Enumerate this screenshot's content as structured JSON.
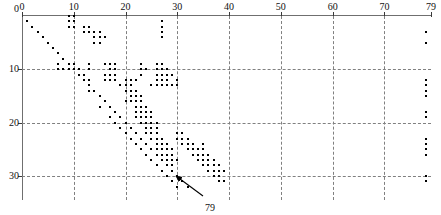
{
  "figure": {
    "title": "",
    "kind": "sparse-matrix-spy-plot"
  },
  "annotation": {
    "label": "79",
    "x": 205,
    "y": 203,
    "arrow_from_x": 203,
    "arrow_from_y": 196,
    "arrow_to_x": 176,
    "arrow_to_y": 176
  },
  "chart_data": {
    "type": "scatter",
    "title": "",
    "xlabel": "",
    "ylabel": "",
    "xlim": [
      0,
      79
    ],
    "ylim": [
      0,
      33
    ],
    "grid": true,
    "legend": null,
    "x_axis_position": "top",
    "y_axis_direction": "down",
    "xticks": [
      0,
      10,
      20,
      30,
      40,
      50,
      60,
      70,
      79
    ],
    "xticklabels": [
      "0",
      "10",
      "20",
      "30",
      "40",
      "50",
      "60",
      "70",
      "79"
    ],
    "yticks": [
      0,
      10,
      20,
      30
    ],
    "yticklabels": [
      "0",
      "10",
      "20",
      "30"
    ],
    "gridlines_x": [
      10,
      20,
      30,
      40,
      50,
      60,
      70
    ],
    "gridlines_y": [
      10,
      20,
      30
    ],
    "marker": "square",
    "marker_color": "#000000",
    "marker_size_px": 2,
    "points": [
      [
        1,
        1
      ],
      [
        2,
        2
      ],
      [
        3,
        3
      ],
      [
        4,
        4
      ],
      [
        5,
        5
      ],
      [
        6,
        6
      ],
      [
        7,
        7
      ],
      [
        8,
        8
      ],
      [
        9,
        9
      ],
      [
        10,
        10
      ],
      [
        11,
        11
      ],
      [
        12,
        12
      ],
      [
        13,
        13
      ],
      [
        14,
        14
      ],
      [
        15,
        15
      ],
      [
        16,
        16
      ],
      [
        17,
        17
      ],
      [
        18,
        18
      ],
      [
        19,
        19
      ],
      [
        20,
        20
      ],
      [
        21,
        21
      ],
      [
        22,
        22
      ],
      [
        23,
        23
      ],
      [
        24,
        24
      ],
      [
        25,
        25
      ],
      [
        26,
        26
      ],
      [
        27,
        27
      ],
      [
        28,
        28
      ],
      [
        29,
        29
      ],
      [
        30,
        30
      ],
      [
        31,
        31
      ],
      [
        32,
        32
      ],
      [
        9,
        0
      ],
      [
        10,
        0
      ],
      [
        9,
        1
      ],
      [
        10,
        1
      ],
      [
        9,
        2
      ],
      [
        10,
        2
      ],
      [
        12,
        2
      ],
      [
        13,
        2
      ],
      [
        12,
        3
      ],
      [
        13,
        3
      ],
      [
        14,
        3
      ],
      [
        15,
        3
      ],
      [
        14,
        4
      ],
      [
        15,
        4
      ],
      [
        16,
        4
      ],
      [
        14,
        5
      ],
      [
        15,
        5
      ],
      [
        27,
        1
      ],
      [
        27,
        2
      ],
      [
        27,
        3
      ],
      [
        27,
        4
      ],
      [
        7,
        9
      ],
      [
        9,
        9
      ],
      [
        10,
        9
      ],
      [
        13,
        9
      ],
      [
        16,
        9
      ],
      [
        17,
        9
      ],
      [
        18,
        9
      ],
      [
        7,
        10
      ],
      [
        8,
        10
      ],
      [
        9,
        10
      ],
      [
        11,
        10
      ],
      [
        13,
        10
      ],
      [
        17,
        10
      ],
      [
        18,
        10
      ],
      [
        23,
        9
      ],
      [
        26,
        9
      ],
      [
        27,
        9
      ],
      [
        11,
        11
      ],
      [
        12,
        11
      ],
      [
        16,
        11
      ],
      [
        17,
        11
      ],
      [
        18,
        11
      ],
      [
        23,
        10
      ],
      [
        24,
        10
      ],
      [
        26,
        10
      ],
      [
        27,
        10
      ],
      [
        28,
        10
      ],
      [
        12,
        12
      ],
      [
        13,
        12
      ],
      [
        16,
        12
      ],
      [
        17,
        12
      ],
      [
        18,
        12
      ],
      [
        23,
        11
      ],
      [
        26,
        11
      ],
      [
        27,
        11
      ],
      [
        28,
        11
      ],
      [
        29,
        11
      ],
      [
        20,
        12
      ],
      [
        21,
        12
      ],
      [
        22,
        12
      ],
      [
        26,
        12
      ],
      [
        27,
        12
      ],
      [
        28,
        12
      ],
      [
        30,
        12
      ],
      [
        19,
        13
      ],
      [
        20,
        13
      ],
      [
        21,
        13
      ],
      [
        25,
        13
      ],
      [
        26,
        13
      ],
      [
        27,
        13
      ],
      [
        28,
        13
      ],
      [
        29,
        13
      ],
      [
        30,
        13
      ],
      [
        13,
        14
      ],
      [
        20,
        14
      ],
      [
        21,
        14
      ],
      [
        22,
        14
      ],
      [
        21,
        15
      ],
      [
        22,
        15
      ],
      [
        23,
        15
      ],
      [
        20,
        16
      ],
      [
        21,
        16
      ],
      [
        22,
        16
      ],
      [
        23,
        16
      ],
      [
        15,
        17
      ],
      [
        22,
        17
      ],
      [
        23,
        17
      ],
      [
        24,
        17
      ],
      [
        22,
        18
      ],
      [
        23,
        18
      ],
      [
        24,
        18
      ],
      [
        25,
        18
      ],
      [
        17,
        19
      ],
      [
        22,
        19
      ],
      [
        23,
        19
      ],
      [
        24,
        19
      ],
      [
        25,
        19
      ],
      [
        18,
        20
      ],
      [
        23,
        20
      ],
      [
        24,
        20
      ],
      [
        25,
        20
      ],
      [
        26,
        20
      ],
      [
        19,
        21
      ],
      [
        24,
        21
      ],
      [
        25,
        21
      ],
      [
        26,
        21
      ],
      [
        20,
        22
      ],
      [
        24,
        22
      ],
      [
        25,
        22
      ],
      [
        26,
        22
      ],
      [
        30,
        22
      ],
      [
        31,
        22
      ],
      [
        21,
        23
      ],
      [
        25,
        23
      ],
      [
        26,
        23
      ],
      [
        27,
        23
      ],
      [
        30,
        23
      ],
      [
        31,
        23
      ],
      [
        32,
        23
      ],
      [
        22,
        24
      ],
      [
        26,
        24
      ],
      [
        27,
        24
      ],
      [
        28,
        24
      ],
      [
        31,
        24
      ],
      [
        32,
        24
      ],
      [
        33,
        24
      ],
      [
        35,
        24
      ],
      [
        23,
        25
      ],
      [
        26,
        25
      ],
      [
        27,
        25
      ],
      [
        28,
        25
      ],
      [
        29,
        25
      ],
      [
        32,
        25
      ],
      [
        33,
        25
      ],
      [
        34,
        25
      ],
      [
        35,
        25
      ],
      [
        24,
        26
      ],
      [
        27,
        26
      ],
      [
        28,
        26
      ],
      [
        29,
        26
      ],
      [
        33,
        26
      ],
      [
        34,
        26
      ],
      [
        35,
        26
      ],
      [
        36,
        26
      ],
      [
        25,
        27
      ],
      [
        27,
        27
      ],
      [
        28,
        27
      ],
      [
        29,
        27
      ],
      [
        30,
        27
      ],
      [
        34,
        27
      ],
      [
        35,
        27
      ],
      [
        36,
        27
      ],
      [
        37,
        27
      ],
      [
        26,
        28
      ],
      [
        28,
        28
      ],
      [
        29,
        28
      ],
      [
        35,
        28
      ],
      [
        36,
        28
      ],
      [
        37,
        28
      ],
      [
        38,
        28
      ],
      [
        27,
        29
      ],
      [
        29,
        29
      ],
      [
        36,
        29
      ],
      [
        37,
        29
      ],
      [
        38,
        29
      ],
      [
        39,
        29
      ],
      [
        28,
        30
      ],
      [
        30,
        30
      ],
      [
        37,
        30
      ],
      [
        38,
        30
      ],
      [
        29,
        31
      ],
      [
        31,
        31
      ],
      [
        38,
        31
      ],
      [
        39,
        31
      ],
      [
        30,
        32
      ],
      [
        32,
        32
      ],
      [
        78,
        3
      ],
      [
        78,
        5
      ],
      [
        78,
        12
      ],
      [
        78,
        13
      ],
      [
        78,
        14
      ],
      [
        78,
        15
      ],
      [
        78,
        18
      ],
      [
        78,
        19
      ],
      [
        78,
        23
      ],
      [
        78,
        24
      ],
      [
        78,
        25
      ],
      [
        78,
        26
      ],
      [
        78,
        30
      ],
      [
        78,
        31
      ]
    ]
  }
}
